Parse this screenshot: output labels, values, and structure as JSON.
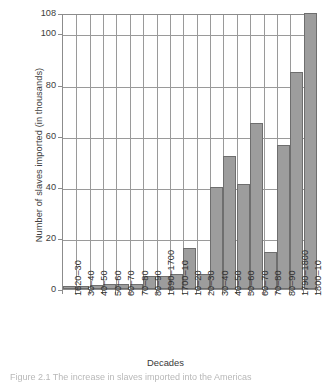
{
  "chart_data": {
    "type": "bar",
    "title": "",
    "xlabel": "Decades",
    "ylabel": "Number of slaves imported (in thousands)",
    "ylim": [
      0,
      108
    ],
    "yticks": [
      0,
      20,
      40,
      60,
      80,
      100,
      108
    ],
    "ytick_labels": [
      "0",
      "20",
      "40",
      "60",
      "80",
      "100",
      "108"
    ],
    "grid": true,
    "legend": "none",
    "bar_color": "#9d9d9d",
    "bar_edge_color": "#6e6e6e",
    "categories": [
      "1620–30",
      "30–40",
      "40–50",
      "50–60",
      "60–70",
      "70–80",
      "80–90",
      "1690–1700",
      "1700–10",
      "10–20",
      "20–30",
      "30–40",
      "40–50",
      "50–60",
      "60–70",
      "70–80",
      "80–90",
      "1790–1800",
      "1800–10"
    ],
    "values": [
      1,
      1,
      1.5,
      2,
      2,
      2,
      5,
      5,
      6,
      16,
      6,
      40,
      52,
      41,
      65,
      14.5,
      56.5,
      85,
      108
    ]
  },
  "axis": {
    "y_title": "Number of slaves imported (in thousands)",
    "x_title": "Decades"
  },
  "caption": {
    "text": "Figure 2.1   The increase in slaves imported into the Americas"
  }
}
